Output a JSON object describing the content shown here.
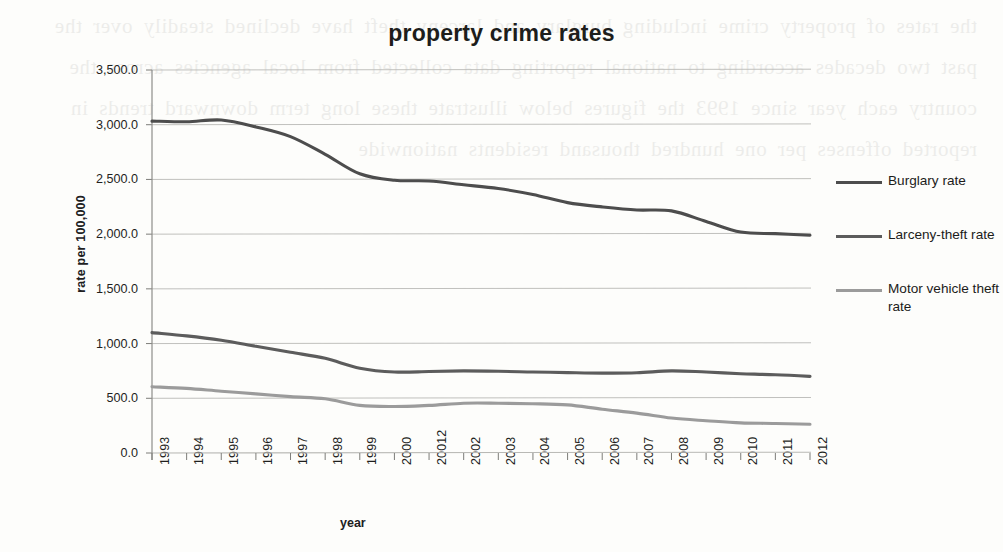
{
  "chart_data": {
    "type": "line",
    "title": "property crime rates",
    "xlabel": "year",
    "ylabel": "rate per 100,000",
    "grid": true,
    "legend_position": "right",
    "ylim": [
      0,
      3500
    ],
    "yticks": [
      "0.0",
      "500.0",
      "1,000.0",
      "1,500.0",
      "2,000.0",
      "2,500.0",
      "3,000.0",
      "3,500.0"
    ],
    "ytick_values": [
      0,
      500,
      1000,
      1500,
      2000,
      2500,
      3000,
      3500
    ],
    "categories": [
      "1993",
      "1994",
      "1995",
      "1996",
      "1997",
      "1998",
      "1999",
      "2000",
      "20012",
      "2002",
      "2003",
      "2004",
      "2005",
      "2006",
      "2007",
      "2008",
      "2009",
      "2010",
      "2011",
      "2012"
    ],
    "series": [
      {
        "name": "Burglary rate",
        "color": "#4d4d4d",
        "values": [
          3033,
          3027,
          3043,
          2980,
          2891,
          2730,
          2551,
          2492,
          2486,
          2451,
          2417,
          2362,
          2288,
          2249,
          2221,
          2212,
          2116,
          2019,
          2005,
          1990
        ]
      },
      {
        "name": "Larceny-theft rate",
        "color": "#5c5c5c",
        "values": [
          1100,
          1070,
          1030,
          975,
          920,
          865,
          775,
          740,
          745,
          750,
          747,
          740,
          735,
          730,
          733,
          750,
          740,
          725,
          715,
          700
        ]
      },
      {
        "name": "Motor vehicle theft rate",
        "color": "#9b9b9b",
        "values": [
          606,
          590,
          565,
          540,
          515,
          495,
          435,
          425,
          435,
          455,
          455,
          450,
          440,
          400,
          365,
          320,
          295,
          275,
          270,
          262
        ]
      }
    ]
  },
  "legend": {
    "items": [
      {
        "label": "Burglary rate",
        "color": "#4d4d4d"
      },
      {
        "label": "Larceny-theft rate",
        "color": "#5c5c5c"
      },
      {
        "label": "Motor vehicle theft rate",
        "color": "#9b9b9b"
      }
    ]
  },
  "scan_bleed": "the rates of property crime including burglary and larceny theft have declined steadily over the past two decades according to national reporting data collected from local agencies across the country each year since 1993 the figures below illustrate these long term downward trends in reported offenses per one hundred thousand residents nationwide"
}
